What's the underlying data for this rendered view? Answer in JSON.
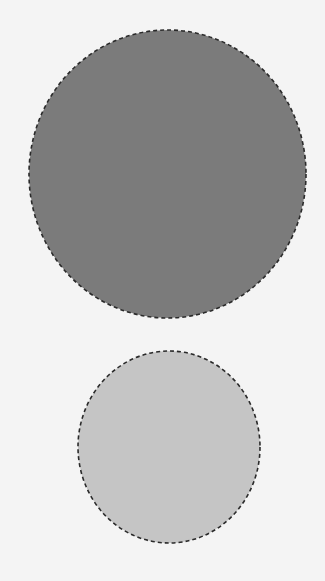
{
  "diagram": {
    "background": "#f4f4f4",
    "shapes": [
      {
        "id": "large-circle",
        "type": "ellipse",
        "cx": 167.5,
        "cy": 174,
        "rx": 138.5,
        "ry": 144,
        "fill": "#7b7b7b",
        "stroke": "#2a2a2a",
        "stroke_style": "dashed"
      },
      {
        "id": "small-circle",
        "type": "ellipse",
        "cx": 169,
        "cy": 447,
        "rx": 91,
        "ry": 96,
        "fill": "#c5c5c5",
        "stroke": "#2a2a2a",
        "stroke_style": "dashed"
      }
    ]
  }
}
